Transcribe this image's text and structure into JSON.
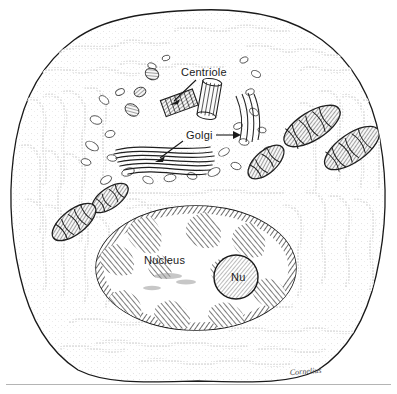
{
  "figure": {
    "style": "pen-and-ink stipple line drawing",
    "background_color": "#ffffff",
    "ink_color": "#1a1a1a",
    "rule_color": "#b4b4b4"
  },
  "labels": {
    "centriole": "Centriole",
    "golgi": "Golgi",
    "nucleus": "Nucleus",
    "nucleolus": "Nu"
  },
  "signature": {
    "text": "Cornelius"
  },
  "structures": {
    "plasma_membrane": "plasma-membrane",
    "rough_er": "rough-endoplasmic-reticulum",
    "mitochondria_count": 5,
    "centrioles_count": 2,
    "golgi_cisternae_count": 7,
    "nucleus": "nucleus",
    "nucleolus": "nucleolus",
    "vesicles": "cytoplasmic-vesicles"
  }
}
